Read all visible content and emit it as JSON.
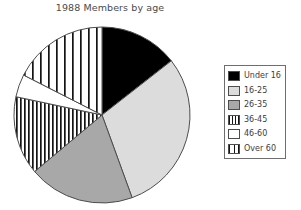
{
  "chart_data": {
    "type": "pie",
    "title": "1988 Members by age",
    "xlabel": "",
    "ylabel": "",
    "legend_position": "right",
    "grid": false,
    "categories": [
      "Under 16",
      "16-25",
      "26-35",
      "36-45",
      "46-60",
      "Over 60"
    ],
    "values": [
      14,
      30,
      19,
      15,
      4,
      18
    ],
    "units": "percent",
    "slices": [
      {
        "label": "Under 16",
        "value": 14,
        "start_angle": 0,
        "end_angle": 52,
        "fill": "#000000",
        "pattern": "solid-black"
      },
      {
        "label": "16-25",
        "value": 30,
        "start_angle": 52,
        "end_angle": 160,
        "fill": "#dcdcdc",
        "pattern": "solid-light-gray"
      },
      {
        "label": "26-35",
        "value": 19,
        "start_angle": 160,
        "end_angle": 230,
        "fill": "#a8a8a8",
        "pattern": "solid-medium-gray"
      },
      {
        "label": "36-45",
        "value": 15,
        "start_angle": 230,
        "end_angle": 282,
        "fill": "#ffffff",
        "pattern": "dense-vertical-stripes"
      },
      {
        "label": "46-60",
        "value": 4,
        "start_angle": 282,
        "end_angle": 297,
        "fill": "#ffffff",
        "pattern": "solid-white"
      },
      {
        "label": "Over 60",
        "value": 18,
        "start_angle": 297,
        "end_angle": 360,
        "fill": "#ffffff",
        "pattern": "wide-vertical-stripes"
      }
    ]
  },
  "legend": {
    "items": [
      {
        "label": "Under 16",
        "pattern": "solid-black"
      },
      {
        "label": "16-25",
        "pattern": "solid-light-gray"
      },
      {
        "label": "26-35",
        "pattern": "solid-medium-gray"
      },
      {
        "label": "36-45",
        "pattern": "dense-vertical-stripes"
      },
      {
        "label": "46-60",
        "pattern": "solid-white"
      },
      {
        "label": "Over 60",
        "pattern": "wide-vertical-stripes"
      }
    ]
  },
  "colors": {
    "black": "#000000",
    "light_gray": "#dcdcdc",
    "medium_gray": "#a8a8a8",
    "white": "#ffffff",
    "outline": "#4d4d4d",
    "text": "#3c3c3c",
    "title_text": "#4a4a4a"
  },
  "geometry": {
    "center_x": 102,
    "center_y": 115,
    "radius": 88
  }
}
